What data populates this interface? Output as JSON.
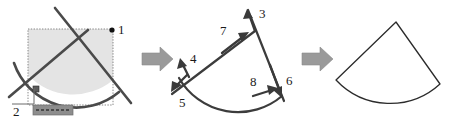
{
  "figure": {
    "name": "trim-operation-three-stage-diagram",
    "background_color": "#ffffff",
    "line_color": "#4a4a4a",
    "fill_color": "#e2e2e2",
    "arrow_color": "#9a9a9a",
    "label_color": "#1a1a1a"
  },
  "panels": [
    {
      "id": "before",
      "name": "selection-stage",
      "caption": "",
      "selection_box": {
        "x": 28,
        "y": 29,
        "width": 85,
        "height": 76
      },
      "markers": [
        {
          "id": "1",
          "label": "1",
          "kind": "pick-point-dot",
          "x": 111,
          "y": 29
        },
        {
          "id": "2",
          "label": "2",
          "kind": "pick-point-grip",
          "x": 36,
          "y": 90
        }
      ],
      "chip": {
        "label": "",
        "x": 33,
        "y": 105,
        "width": 40,
        "height": 10
      }
    },
    {
      "id": "steps",
      "name": "direction-stage",
      "caption": "",
      "markers": [
        {
          "id": "3",
          "label": "3",
          "direction": "up"
        },
        {
          "id": "4",
          "label": "4",
          "direction": "up-left"
        },
        {
          "id": "5",
          "label": "5",
          "direction": "down-left"
        },
        {
          "id": "6",
          "label": "6",
          "direction": "down-right"
        },
        {
          "id": "7",
          "label": "7",
          "direction": "up-right"
        },
        {
          "id": "8",
          "label": "8",
          "direction": "right-along-arc"
        }
      ]
    },
    {
      "id": "after",
      "name": "result-stage",
      "caption": "",
      "shape": "circular-sector-wedge"
    }
  ],
  "flow_arrows": [
    {
      "id": "arrow-1",
      "name": "flow-arrow-first",
      "direction": "right"
    },
    {
      "id": "arrow-2",
      "name": "flow-arrow-second",
      "direction": "right"
    }
  ]
}
